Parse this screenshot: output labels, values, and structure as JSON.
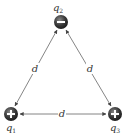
{
  "diagram": {
    "charges": [
      {
        "id": "q1",
        "label": "q",
        "subscript": "1",
        "sign": "+",
        "x": 11,
        "y": 114
      },
      {
        "id": "q2",
        "label": "q",
        "subscript": "2",
        "sign": "−",
        "x": 61,
        "y": 22
      },
      {
        "id": "q3",
        "label": "q",
        "subscript": "3",
        "sign": "+",
        "x": 115,
        "y": 114
      }
    ],
    "distances": {
      "left": "d",
      "right": "d",
      "bottom": "d"
    },
    "colors": {
      "charge_fill": "#3a3a3a",
      "line": "#555555",
      "text": "#333333"
    }
  }
}
